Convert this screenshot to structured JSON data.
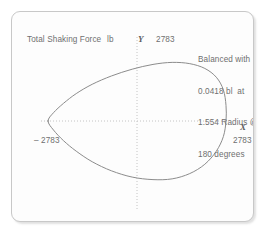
{
  "chart_data": {
    "type": "line",
    "title": "Total Shaking Force",
    "unit": "lb",
    "xlabel": "X",
    "ylabel": "Y",
    "xlim": [
      -2783,
      2783
    ],
    "ylim": [
      -2783,
      2783
    ],
    "x_max_tick": "2783",
    "x_min_tick": "– 2783",
    "y_max_tick": "2783",
    "y_min_tick": "– 2783",
    "grid": false,
    "axes_style": "dotted-crosshair",
    "curve_color": "#8c8c8c",
    "annotation": [
      "Balanced with",
      "0.0418 bl  at",
      "1.554 Radius @",
      "180 degrees"
    ],
    "annotation_text": "Balanced with 0.0418 bl at 1.554 Radius @ 180 degrees",
    "curve_description": "closed cardioid-like polar force locus, cusp at left on the X axis",
    "points": [
      [
        -2783,
        0
      ],
      [
        -2610,
        330
      ],
      [
        -2300,
        700
      ],
      [
        -1900,
        1090
      ],
      [
        -1400,
        1460
      ],
      [
        -800,
        1790
      ],
      [
        -150,
        2060
      ],
      [
        500,
        2250
      ],
      [
        1100,
        2330
      ],
      [
        1650,
        2280
      ],
      [
        2120,
        2090
      ],
      [
        2480,
        1740
      ],
      [
        2700,
        1240
      ],
      [
        2783,
        620
      ],
      [
        2783,
        0
      ],
      [
        2700,
        -620
      ],
      [
        2480,
        -1200
      ],
      [
        2120,
        -1720
      ],
      [
        1650,
        -2090
      ],
      [
        1100,
        -2300
      ],
      [
        500,
        -2330
      ],
      [
        -150,
        -2230
      ],
      [
        -800,
        -1980
      ],
      [
        -1400,
        -1620
      ],
      [
        -1900,
        -1200
      ],
      [
        -2300,
        -780
      ],
      [
        -2610,
        -360
      ],
      [
        -2783,
        0
      ]
    ]
  },
  "colors": {
    "frame_border": "#c8c8c8",
    "text": "#6f6f6f",
    "axis": "#c4c4c4",
    "curve": "#8c8c8c"
  }
}
